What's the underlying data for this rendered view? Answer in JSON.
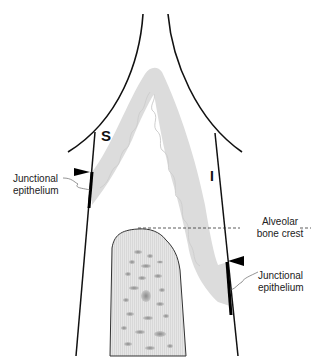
{
  "diagram": {
    "type": "anatomical cross-section",
    "labels": {
      "s_marker": "S",
      "i_marker": "I",
      "junctional_left_line1": "Junctional",
      "junctional_left_line2": "epithelium",
      "junctional_right_line1": "Junctional",
      "junctional_right_line2": "epithelium",
      "alveolar_line1": "Alveolar",
      "alveolar_line2": "bone crest"
    },
    "colors": {
      "gingiva_fill": "#dcdcdc",
      "bone_fill": "#e4e4e4",
      "outline": "#111111",
      "background": "#ffffff"
    }
  }
}
